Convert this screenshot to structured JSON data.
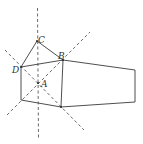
{
  "figure": {
    "type": "geometry-diagram",
    "labels": {
      "A": "A",
      "B": "B",
      "C": "C",
      "D": "D"
    },
    "points": {
      "C": [
        37,
        41
      ],
      "B": [
        63,
        60
      ],
      "D": [
        21,
        67
      ],
      "A": [
        38,
        83
      ],
      "E": [
        21,
        100
      ],
      "F": [
        61,
        107
      ],
      "G": [
        135,
        70
      ],
      "H": [
        135,
        102
      ]
    },
    "colors": {
      "stroke": "#3a3a3a",
      "background": "#ffffff"
    }
  }
}
